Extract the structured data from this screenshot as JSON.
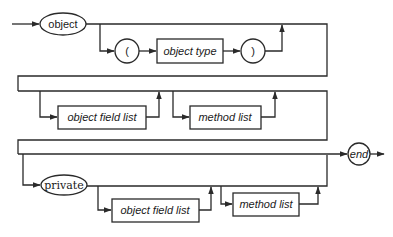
{
  "diagram": {
    "type": "syntax-diagram",
    "start": {
      "label": "object",
      "shape": "oval"
    },
    "row1": {
      "optional_group": [
        {
          "label": "(",
          "shape": "circle"
        },
        {
          "label": "object type",
          "shape": "box",
          "style": "italic"
        },
        {
          "label": ")",
          "shape": "circle"
        }
      ]
    },
    "row2": {
      "optional_items": [
        {
          "label": "object field list",
          "shape": "box",
          "style": "italic"
        },
        {
          "label": "method list",
          "shape": "box",
          "style": "italic"
        }
      ]
    },
    "row3": {
      "optional_keyword": {
        "label": "private",
        "shape": "oval"
      },
      "optional_items": [
        {
          "label": "object field list",
          "shape": "box",
          "style": "italic"
        },
        {
          "label": "method list",
          "shape": "box",
          "style": "italic"
        }
      ]
    },
    "end": {
      "label": "end",
      "shape": "circle",
      "style": "italic"
    }
  }
}
